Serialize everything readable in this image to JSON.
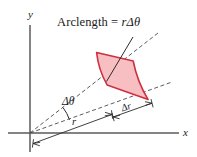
{
  "figure": {
    "kind": "polar-area-element-diagram",
    "background_color": "#ffffff",
    "axis_color": "#555555",
    "construction_line_color": "#4a4a4a",
    "region_fill_color": "#f7bfc2",
    "region_stroke_color": "#cf3040",
    "text_color": "#1a1a1a"
  },
  "axes": {
    "x_label": "x",
    "y_label": "y",
    "origin_px": [
      30,
      133
    ],
    "x_axis_end_px": [
      179,
      133
    ],
    "y_axis_top_px": [
      30,
      25
    ]
  },
  "labels": {
    "arclength_prefix": "Arclength = ",
    "arclength_radius_symbol": "r",
    "arclength_delta_theta": "Δθ",
    "arclength_full": "Arclength = rΔθ",
    "delta_theta": "Δθ",
    "radius": "r",
    "delta_r": "Δr"
  },
  "geometry": {
    "inner_radius_px": 82,
    "outer_radius_px": 118,
    "start_angle_deg": -20,
    "end_angle_deg": -38,
    "theta_arc_radius_px": 42,
    "region_vertices_px": [
      [
        97,
        52
      ],
      [
        134,
        61
      ],
      [
        148,
        100
      ],
      [
        108,
        85
      ]
    ]
  },
  "annotations": {
    "leader_line_from_px": [
      133,
      38
    ],
    "leader_line_to_px": [
      107,
      81
    ],
    "radius_dimension_from_px": [
      32,
      142
    ],
    "radius_dimension_to_px": [
      110,
      113
    ],
    "delta_r_dimension_from_px": [
      112,
      117
    ],
    "delta_r_dimension_to_px": [
      152,
      103
    ]
  }
}
